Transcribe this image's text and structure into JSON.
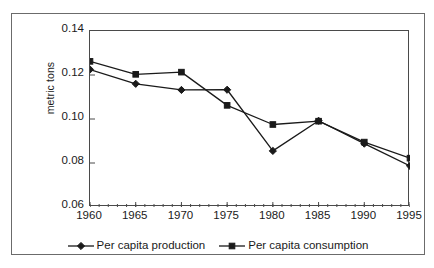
{
  "chart_data": {
    "type": "line",
    "title": "",
    "subtitle": "",
    "xlabel": "",
    "ylabel": "metric tons",
    "x": [
      1960,
      1965,
      1970,
      1975,
      1980,
      1985,
      1990,
      1995
    ],
    "categories": [
      "1960",
      "1965",
      "1970",
      "1975",
      "1980",
      "1985",
      "1990",
      "1995"
    ],
    "series": [
      {
        "name": "Per capita production",
        "marker": "diamond",
        "color": "#1a1a1a",
        "values": [
          0.1225,
          0.116,
          0.1132,
          0.1133,
          0.0855,
          0.0992,
          0.0888,
          0.0787
        ]
      },
      {
        "name": "Per capita consumption",
        "marker": "square",
        "color": "#1a1a1a",
        "values": [
          0.1262,
          0.1203,
          0.1213,
          0.1062,
          0.0975,
          0.099,
          0.0895,
          0.0822
        ]
      }
    ],
    "xlim": [
      1960,
      1995
    ],
    "ylim": [
      0.06,
      0.14
    ],
    "ytick_labels": [
      "0.06",
      "0.08",
      "0.10",
      "0.12",
      "0.14"
    ],
    "ytick_values": [
      0.06,
      0.08,
      0.1,
      0.12,
      0.14
    ],
    "xtick_labels": [
      "1960",
      "1965",
      "1970",
      "1975",
      "1980",
      "1985",
      "1990",
      "1995"
    ],
    "xtick_values": [
      1960,
      1965,
      1970,
      1975,
      1980,
      1985,
      1990,
      1995
    ],
    "x_minor_tick_interval": 1,
    "grid": false,
    "legend_position": "bottom",
    "legend_entries": [
      "Per capita production",
      "Per capita consumption"
    ],
    "plot_border": true,
    "background_color": "#ffffff",
    "line_color": "#1a1a1a",
    "frame_color": "#6b6b6b"
  }
}
